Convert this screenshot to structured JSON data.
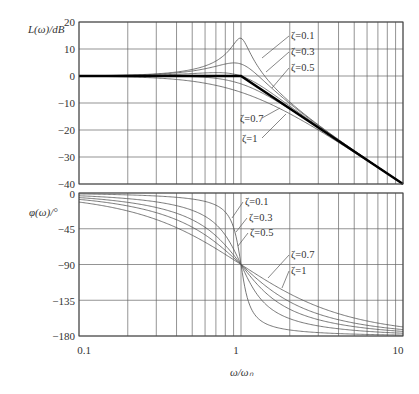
{
  "chart_data": [
    {
      "type": "line",
      "title": "",
      "panel": "magnitude",
      "xlabel": "ω/ωn",
      "ylabel": "L(ω)/dB",
      "xscale": "log",
      "xlim": [
        0.1,
        10
      ],
      "ylim": [
        -40,
        20
      ],
      "yticks": [
        20,
        10,
        0,
        -10,
        -20,
        -30,
        -40
      ],
      "grid": true,
      "series": [
        {
          "name": "ζ=0.1",
          "zeta": 0.1
        },
        {
          "name": "ζ=0.3",
          "zeta": 0.3
        },
        {
          "name": "ζ=0.5",
          "zeta": 0.5
        },
        {
          "name": "ζ=0.7",
          "zeta": 0.7
        },
        {
          "name": "ζ=1",
          "zeta": 1.0
        },
        {
          "name": "asymptote",
          "points": [
            [
              0.1,
              0
            ],
            [
              1,
              0
            ],
            [
              10,
              -40
            ]
          ]
        }
      ],
      "sample_values": {
        "x": [
          0.1,
          0.5,
          1,
          2,
          10
        ],
        "ζ=0.1": [
          0.09,
          2.45,
          13.98,
          -9.5,
          -39.9
        ],
        "ζ=0.3": [
          0.07,
          1.7,
          4.44,
          -10.3,
          -40.0
        ],
        "ζ=0.5": [
          0.04,
          0.46,
          0.0,
          -11.1,
          -40.1
        ],
        "ζ=0.7": [
          -0.0,
          -0.97,
          -2.92,
          -12.3,
          -40.3
        ],
        "ζ=1": [
          -0.09,
          -1.94,
          -6.02,
          -13.98,
          -40.1
        ]
      }
    },
    {
      "type": "line",
      "title": "",
      "panel": "phase",
      "xlabel": "ω/ωn",
      "ylabel": "φ(ω)/°",
      "xscale": "log",
      "xlim": [
        0.1,
        10
      ],
      "ylim": [
        -180,
        0
      ],
      "yticks": [
        0,
        -45,
        -90,
        -135,
        -180
      ],
      "xticks": [
        0.1,
        1,
        10
      ],
      "grid": true,
      "series": [
        {
          "name": "ζ=0.1",
          "zeta": 0.1
        },
        {
          "name": "ζ=0.3",
          "zeta": 0.3
        },
        {
          "name": "ζ=0.5",
          "zeta": 0.5
        },
        {
          "name": "ζ=0.7",
          "zeta": 0.7
        },
        {
          "name": "ζ=1",
          "zeta": 1.0
        }
      ],
      "sample_values": {
        "x": [
          0.1,
          0.5,
          1,
          2,
          10
        ],
        "ζ=0.1": [
          -1.2,
          -7.6,
          -90,
          -172.4,
          -178.8
        ],
        "ζ=0.3": [
          -3.5,
          -21.8,
          -90,
          -158.2,
          -176.5
        ],
        "ζ=0.5": [
          -5.8,
          -33.7,
          -90,
          -146.3,
          -174.2
        ],
        "ζ=0.7": [
          -8.1,
          -43.0,
          -90,
          -137.0,
          -171.9
        ],
        "ζ=1": [
          -11.4,
          -53.1,
          -90,
          -126.9,
          -168.6
        ]
      }
    }
  ],
  "labels": {
    "mag_ylabel": "L(ω)/dB",
    "phase_ylabel": "φ(ω)/°",
    "xlabel": "ω/ωₙ",
    "x_tick_0": "0.1",
    "x_tick_1": "1",
    "x_tick_2": "10",
    "mag_ticks": [
      "20",
      "10",
      "0",
      "−10",
      "−20",
      "−30",
      "−40"
    ],
    "phase_ticks": [
      "0",
      "−45",
      "−90",
      "−135",
      "−180"
    ]
  },
  "annotations": {
    "mag": [
      {
        "text": "ζ=0.1",
        "tx": 291,
        "ty": 39
      },
      {
        "text": "ζ=0.3",
        "tx": 291,
        "ty": 55
      },
      {
        "text": "ζ=0.5",
        "tx": 291,
        "ty": 71
      },
      {
        "text": "ζ=0.7",
        "tx": 240,
        "ty": 122
      },
      {
        "text": "ζ=1",
        "tx": 242,
        "ty": 142
      }
    ],
    "phase": [
      {
        "text": "ζ=0.1",
        "tx": 245,
        "ty": 205
      },
      {
        "text": "ζ=0.3",
        "tx": 249,
        "ty": 221
      },
      {
        "text": "ζ=0.5",
        "tx": 250,
        "ty": 236
      },
      {
        "text": "ζ=0.7",
        "tx": 291,
        "ty": 258
      },
      {
        "text": "ζ=1",
        "tx": 291,
        "ty": 274
      }
    ]
  },
  "colors": {
    "curve": "#555555",
    "asymptote": "#000000",
    "grid": "#666666",
    "frame": "#444444"
  }
}
